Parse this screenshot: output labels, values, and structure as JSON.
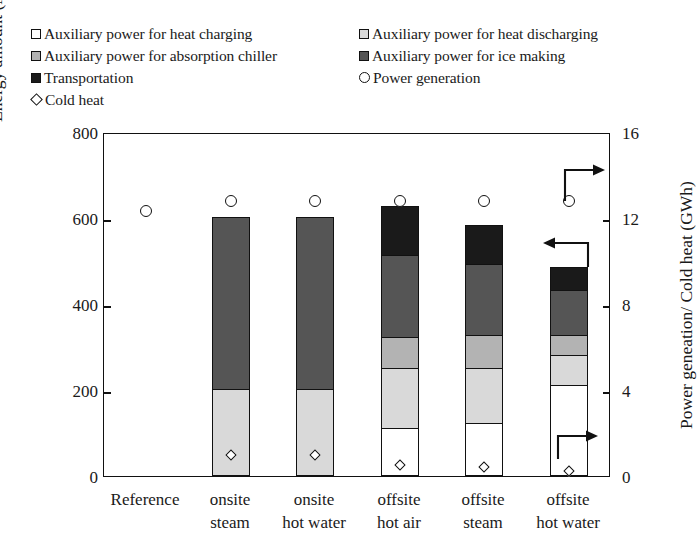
{
  "legend": {
    "items": [
      {
        "marker": "square-white",
        "label": "Auxiliary power for heat charging",
        "color": "#ffffff"
      },
      {
        "marker": "square-light",
        "label": "Auxiliary power for heat discharging",
        "color": "#d9d9d9"
      },
      {
        "marker": "square-mid",
        "label": "Auxiliary power for absorption chiller",
        "color": "#b3b3b3"
      },
      {
        "marker": "square-dark",
        "label": "Auxiliary power for ice making",
        "color": "#555555"
      },
      {
        "marker": "square-black",
        "label": "Transportation",
        "color": "#1a1a1a"
      },
      {
        "marker": "circle-open",
        "label": "Power generation",
        "color": "#ffffff"
      },
      {
        "marker": "diamond-open",
        "label": "Cold heat",
        "color": "#ffffff"
      }
    ]
  },
  "chart_data": {
    "type": "bar",
    "subtype": "stacked-bar-with-markers",
    "title": "",
    "xlabel": "",
    "ylabel": "Energy amount (MWh)",
    "y2label": "Power geneation/ Cold heat (GWh)",
    "ylim": [
      0,
      800
    ],
    "y2lim": [
      0,
      16
    ],
    "yticks": [
      0,
      200,
      400,
      600,
      800
    ],
    "y2ticks": [
      0,
      4,
      8,
      12,
      16
    ],
    "grid": false,
    "legend_position": "above-plot",
    "categories": [
      "Reference",
      "onsite steam",
      "onsite hot water",
      "offsite hot air",
      "offsite steam",
      "offsite hot water"
    ],
    "category_lines": [
      [
        "Reference",
        ""
      ],
      [
        "onsite",
        "steam"
      ],
      [
        "onsite",
        "hot water"
      ],
      [
        "offsite",
        "hot air"
      ],
      [
        "offsite",
        "steam"
      ],
      [
        "offsite",
        "hot water"
      ]
    ],
    "stack_order_bottom_to_top": [
      "Auxiliary power for heat charging",
      "Auxiliary power for heat discharging",
      "Auxiliary power for absorption chiller",
      "Auxiliary power for ice making",
      "Transportation"
    ],
    "series": [
      {
        "name": "Auxiliary power for heat charging",
        "color": "#ffffff",
        "values": [
          0,
          0,
          0,
          110,
          122,
          210
        ]
      },
      {
        "name": "Auxiliary power for heat discharging",
        "color": "#d9d9d9",
        "values": [
          0,
          200,
          200,
          140,
          128,
          68
        ]
      },
      {
        "name": "Auxiliary power for absorption chiller",
        "color": "#b3b3b3",
        "values": [
          0,
          0,
          0,
          70,
          75,
          47
        ]
      },
      {
        "name": "Auxiliary power for ice making",
        "color": "#555555",
        "values": [
          0,
          400,
          400,
          192,
          166,
          105
        ]
      },
      {
        "name": "Transportation",
        "color": "#1a1a1a",
        "values": [
          0,
          0,
          0,
          113,
          91,
          54
        ]
      }
    ],
    "bar_totals": [
      0,
      600,
      600,
      625,
      582,
      484
    ],
    "markers": [
      {
        "name": "Power generation",
        "marker": "circle-open",
        "axis": "right",
        "unit": "GWh",
        "values": [
          12.4,
          12.9,
          12.9,
          12.9,
          12.9,
          12.9
        ]
      },
      {
        "name": "Cold heat",
        "marker": "diamond-open",
        "axis": "right",
        "unit": "GWh",
        "values": [
          null,
          1.05,
          1.05,
          0.62,
          0.52,
          0.33
        ]
      }
    ],
    "annotations": [
      {
        "type": "arrow",
        "direction": "left",
        "target": "left-axis",
        "note": "bars read on left axis"
      },
      {
        "type": "arrow",
        "direction": "right",
        "target": "right-axis",
        "note": "cold heat reads on right axis"
      },
      {
        "type": "arrow",
        "direction": "right",
        "target": "right-axis",
        "note": "power generation reads on right axis"
      }
    ]
  }
}
